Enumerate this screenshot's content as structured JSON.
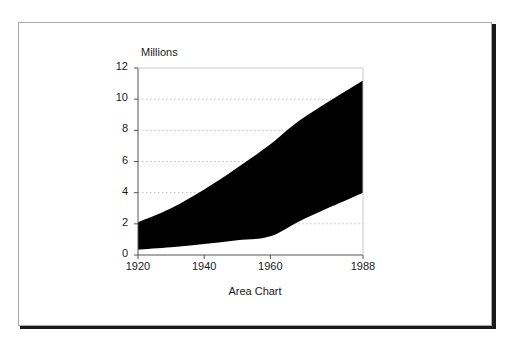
{
  "figure": {
    "caption": "Area Chart",
    "frame_color": "#a9a9a9",
    "shadow_color": "#1a1a1a"
  },
  "chart_data": {
    "type": "area",
    "title": "Area Chart",
    "xlabel": "",
    "ylabel": "Millions",
    "axis_title_top": "Millions",
    "xlim": [
      1920,
      1988
    ],
    "ylim": [
      0,
      12
    ],
    "grid": true,
    "grid_style": "dotted",
    "grid_color": "#bfbfbf",
    "legend": "none",
    "fill_color": "#000000",
    "plot_background": "#ffffff",
    "x": [
      1920,
      1930,
      1940,
      1950,
      1960,
      1970,
      1988
    ],
    "xticks": [
      1920,
      1940,
      1960,
      1988
    ],
    "yticks": [
      0,
      2,
      4,
      6,
      8,
      10,
      12
    ],
    "series": [
      {
        "name": "Lower Boundary",
        "values": [
          0.35,
          0.5,
          0.7,
          0.95,
          1.2,
          2.3,
          4.0
        ]
      },
      {
        "name": "Upper Boundary",
        "values": [
          2.1,
          3.0,
          4.2,
          5.6,
          7.1,
          8.8,
          11.2
        ]
      }
    ],
    "band_label": "Filled region between lower and upper boundary"
  }
}
